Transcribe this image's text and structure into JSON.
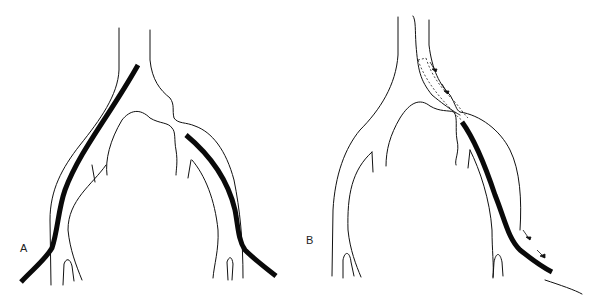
{
  "figure": {
    "panels": [
      {
        "id": "A",
        "label": "A",
        "description": "Bifurcation with two straight catheters, one in each iliac branch"
      },
      {
        "id": "B",
        "label": "B",
        "description": "Catheter advanced over wire from right branch across bifurcation; dotted outline shows prior position, arrows show direction of pull-back"
      }
    ],
    "colors": {
      "line": "#111111",
      "background": "#ffffff"
    }
  }
}
